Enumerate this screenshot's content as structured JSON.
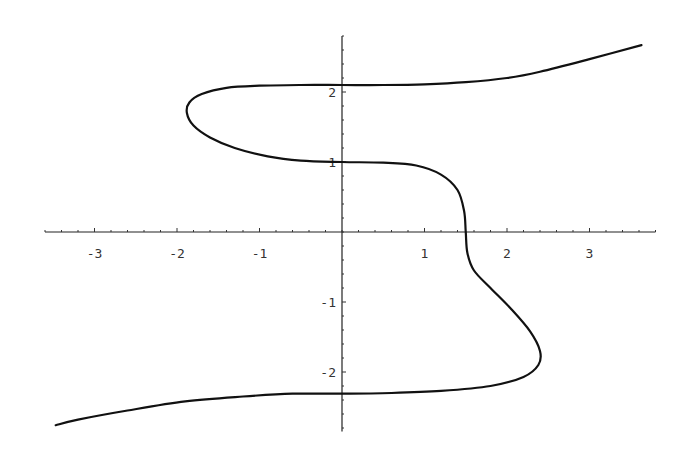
{
  "chart_data": {
    "type": "line",
    "title": "",
    "xlabel": "",
    "ylabel": "",
    "xlim": [
      -3.6,
      3.8
    ],
    "ylim": [
      -2.85,
      2.8
    ],
    "grid": false,
    "legend": null,
    "x_ticks": [
      -3,
      -2,
      -1,
      1,
      2,
      3
    ],
    "y_ticks": [
      -2,
      -1,
      1,
      2
    ],
    "x_tick_labels": [
      "-3",
      "-2",
      "-1",
      "1",
      "2",
      "3"
    ],
    "y_tick_labels": [
      "-2",
      "-1",
      "1",
      "2"
    ],
    "minor_tick_step": 0.2,
    "series": [
      {
        "name": "curve",
        "color": "#111111",
        "points": [
          [
            3.63,
            2.67
          ],
          [
            3.0,
            2.47
          ],
          [
            2.4,
            2.29
          ],
          [
            2.0,
            2.2
          ],
          [
            1.5,
            2.14
          ],
          [
            1.0,
            2.11
          ],
          [
            0.5,
            2.1
          ],
          [
            0.0,
            2.1
          ],
          [
            -0.5,
            2.1
          ],
          [
            -1.0,
            2.09
          ],
          [
            -1.4,
            2.06
          ],
          [
            -1.7,
            1.97
          ],
          [
            -1.85,
            1.85
          ],
          [
            -1.88,
            1.7
          ],
          [
            -1.8,
            1.52
          ],
          [
            -1.6,
            1.35
          ],
          [
            -1.3,
            1.2
          ],
          [
            -0.9,
            1.08
          ],
          [
            -0.5,
            1.02
          ],
          [
            0.0,
            1.0
          ],
          [
            0.5,
            0.99
          ],
          [
            0.9,
            0.95
          ],
          [
            1.2,
            0.82
          ],
          [
            1.4,
            0.6
          ],
          [
            1.48,
            0.3
          ],
          [
            1.5,
            0.0
          ],
          [
            1.52,
            -0.3
          ],
          [
            1.6,
            -0.55
          ],
          [
            1.8,
            -0.8
          ],
          [
            2.05,
            -1.1
          ],
          [
            2.28,
            -1.42
          ],
          [
            2.4,
            -1.7
          ],
          [
            2.38,
            -1.9
          ],
          [
            2.2,
            -2.07
          ],
          [
            1.8,
            -2.2
          ],
          [
            1.2,
            -2.27
          ],
          [
            0.6,
            -2.3
          ],
          [
            0.0,
            -2.31
          ],
          [
            -0.6,
            -2.31
          ],
          [
            -1.2,
            -2.35
          ],
          [
            -1.9,
            -2.42
          ],
          [
            -2.6,
            -2.55
          ],
          [
            -3.2,
            -2.68
          ],
          [
            -3.47,
            -2.76
          ]
        ]
      }
    ]
  }
}
